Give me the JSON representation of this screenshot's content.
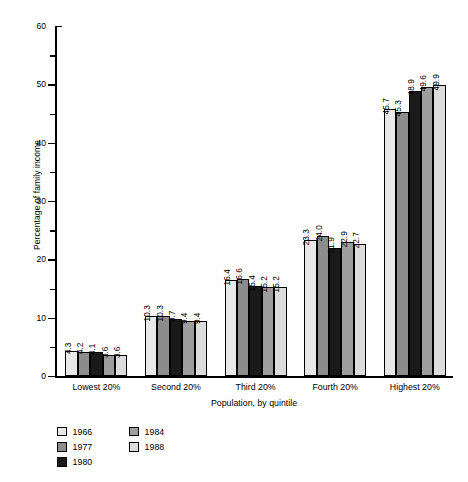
{
  "chart_data": {
    "type": "bar",
    "title": "",
    "xlabel": "Population, by quintile",
    "ylabel": "Percentage of family income",
    "ylim": [
      0,
      60
    ],
    "ytick_labels": [
      "0",
      "10",
      "20",
      "30",
      "40",
      "50",
      "60"
    ],
    "ytick_values": [
      0,
      10,
      20,
      30,
      40,
      50,
      60
    ],
    "yminor_values": [
      5,
      15,
      25,
      35,
      45,
      55
    ],
    "grid": false,
    "legend_position": "bottom-left",
    "categories": [
      "Lowest 20%",
      "Second 20%",
      "Third 20%",
      "Fourth 20%",
      "Highest 20%"
    ],
    "series": [
      {
        "name": "1966",
        "color": "#e8e8e8",
        "values": [
          4.3,
          10.3,
          16.4,
          23.3,
          45.7
        ],
        "labels": [
          "4.3",
          "10.3",
          "16.4",
          "23.3",
          "45.7"
        ]
      },
      {
        "name": "1977",
        "color": "#8c8c8c",
        "values": [
          4.2,
          10.3,
          16.6,
          24.0,
          45.3
        ],
        "labels": [
          "4.2",
          "10.3",
          "16.6",
          "24.0",
          "45.3"
        ]
      },
      {
        "name": "1980",
        "color": "#1a1a1a",
        "values": [
          4.1,
          9.7,
          15.4,
          21.9,
          48.9
        ],
        "labels": [
          "4.1",
          "9.7",
          "15.4",
          "21.9",
          "48.9"
        ]
      },
      {
        "name": "1984",
        "color": "#9e9e9e",
        "values": [
          3.6,
          9.4,
          15.2,
          22.9,
          49.6
        ],
        "labels": [
          "3.6",
          "9.4",
          "15.2",
          "22.9",
          "49.6"
        ]
      },
      {
        "name": "1988",
        "color": "#dcdcdc",
        "values": [
          3.6,
          9.4,
          15.2,
          22.7,
          49.9
        ],
        "labels": [
          "3.6",
          "9.4",
          "15.2",
          "22.7",
          "49.9"
        ]
      }
    ]
  }
}
